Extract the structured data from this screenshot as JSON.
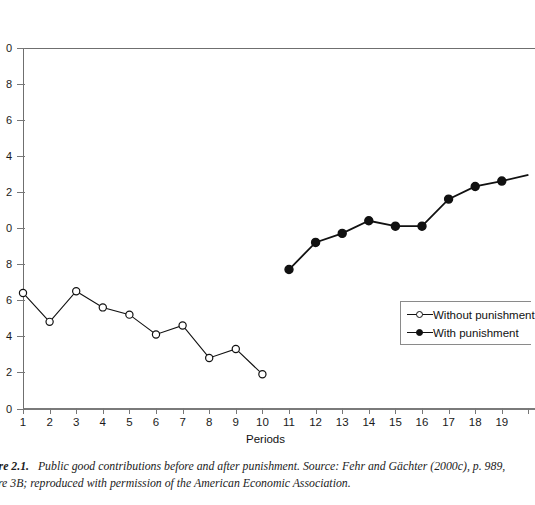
{
  "chart_data": {
    "type": "line",
    "title": "",
    "xlabel": "Periods",
    "ylabel": "",
    "xlim": [
      1,
      20
    ],
    "ylim": [
      0,
      20
    ],
    "grid": false,
    "legend_position": "right",
    "x": [
      1,
      2,
      3,
      4,
      5,
      6,
      7,
      8,
      9,
      10,
      11,
      12,
      13,
      14,
      15,
      16,
      17,
      18,
      19
    ],
    "xticklabels": [
      "1",
      "2",
      "3",
      "4",
      "5",
      "6",
      "7",
      "8",
      "9",
      "10",
      "11",
      "12",
      "13",
      "14",
      "15",
      "16",
      "17",
      "18",
      "19"
    ],
    "yticks": [
      0,
      2,
      4,
      6,
      8,
      10,
      12,
      14,
      16,
      18,
      20
    ],
    "yticklabels": [
      "0",
      "2",
      "4",
      "6",
      "8",
      "0",
      "2",
      "4",
      "6",
      "8",
      "0"
    ],
    "series": [
      {
        "name": "Without punishment",
        "marker": "open-circle",
        "x": [
          1,
          2,
          3,
          4,
          5,
          6,
          7,
          8,
          9,
          10
        ],
        "values": [
          6.4,
          4.8,
          6.5,
          5.6,
          5.2,
          4.1,
          4.6,
          2.8,
          3.3,
          1.9
        ]
      },
      {
        "name": "With punishment",
        "marker": "filled-circle",
        "x": [
          11,
          12,
          13,
          14,
          15,
          16,
          17,
          18,
          19
        ],
        "values": [
          7.7,
          9.2,
          9.7,
          10.4,
          10.1,
          10.1,
          11.6,
          12.3,
          12.6
        ]
      }
    ]
  },
  "legend": {
    "items": [
      {
        "label": "Without punishment",
        "marker": "open-circle"
      },
      {
        "label": "With punishment",
        "marker": "filled-circle"
      }
    ]
  },
  "axis": {
    "x_title": "Periods"
  },
  "caption": {
    "line1_label": "ure 2.1.",
    "line1_text": "Public good contributions before and after punishment. Source: Fehr and Gächter (2000c), p. 989,",
    "line2_text": "ure 3B; reproduced with permission of the American Economic Association."
  }
}
